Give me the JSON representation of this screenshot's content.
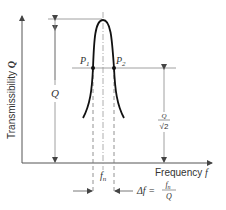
{
  "diagram": {
    "y_axis_label": "Transmissibility",
    "y_axis_symbol": "Q",
    "x_axis_label": "Frequency",
    "x_axis_symbol": "f",
    "peak_label": "Q",
    "point1_label": "P",
    "point1_sub": "1",
    "point2_label": "P",
    "point2_sub": "2",
    "half_power_num": "Q",
    "half_power_den": "√2",
    "fn_label": "f",
    "fn_sub": "n",
    "delta_f_prefix": "Δf =",
    "delta_f_num": "f",
    "delta_f_num_sub": "n",
    "delta_f_den": "Q"
  },
  "colors": {
    "curve": "#111111",
    "axis": "#555555",
    "guide": "#888888"
  }
}
